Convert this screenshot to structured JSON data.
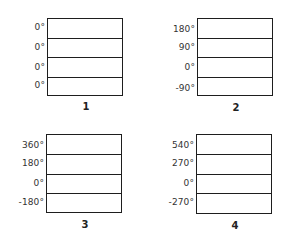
{
  "figure": {
    "panels": [
      {
        "caption": "1",
        "labels": [
          "0°",
          "0°",
          "0°",
          "0°"
        ]
      },
      {
        "caption": "2",
        "labels": [
          "180°",
          "90°",
          "0°",
          "-90°"
        ]
      },
      {
        "caption": "3",
        "labels": [
          "360°",
          "180°",
          "0°",
          "-180°"
        ]
      },
      {
        "caption": "4",
        "labels": [
          "540°",
          "270°",
          "0°",
          "-270°"
        ]
      }
    ],
    "line_color": "#1e1e1e",
    "text_color": "#333333"
  }
}
